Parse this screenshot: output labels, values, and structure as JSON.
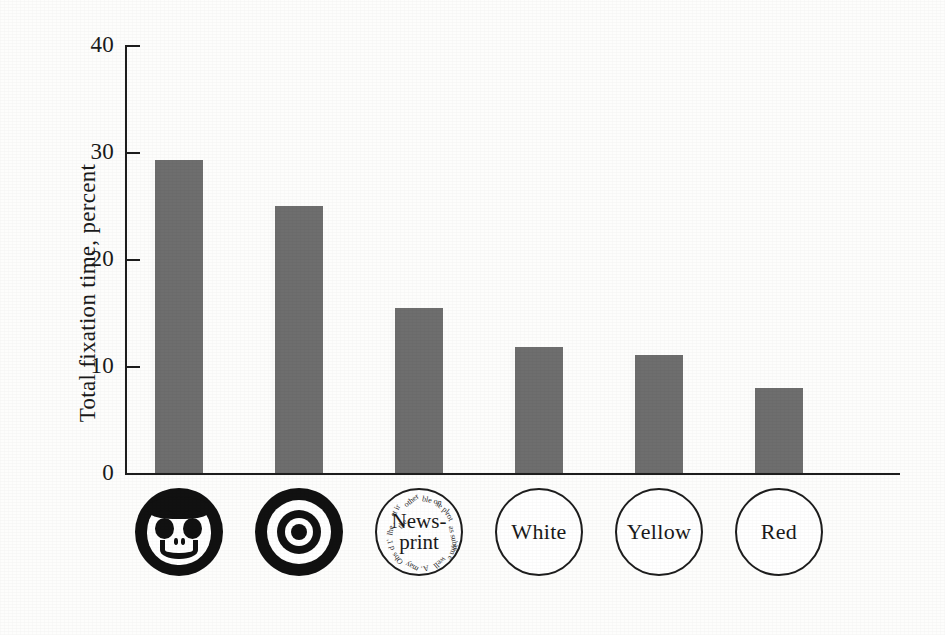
{
  "chart_data": {
    "type": "bar",
    "title": "",
    "subtitle": "",
    "xlabel": "",
    "ylabel": "Total fixation time, percent",
    "ylim": [
      0,
      40
    ],
    "yticks": [
      "0",
      "10",
      "20",
      "30",
      "40"
    ],
    "ytick_values": [
      0,
      10,
      20,
      30,
      40
    ],
    "grid": false,
    "legend": "none",
    "bar_color": "#6e6e6e",
    "axis_color": "#1d1d1d",
    "background_color": "#fdfdfc",
    "categories": [
      "Face",
      "Bullseye",
      "Newsprint",
      "White",
      "Yellow",
      "Red"
    ],
    "values": [
      29.3,
      25.0,
      15.4,
      11.8,
      11.0,
      7.9
    ]
  },
  "axis": {
    "y_title": "Total fixation time, percent",
    "ticks": [
      {
        "label": "40",
        "value": 40
      },
      {
        "label": "30",
        "value": 30
      },
      {
        "label": "20",
        "value": 20
      },
      {
        "label": "10",
        "value": 10
      },
      {
        "label": "0",
        "value": 0
      }
    ]
  },
  "categories": [
    {
      "id": "face",
      "icon": "smiley-face-icon",
      "label": "",
      "value": 29.3
    },
    {
      "id": "bullseye",
      "icon": "bullseye-target-icon",
      "label": "",
      "value": 25.0
    },
    {
      "id": "newsprint",
      "icon": "newsprint-circle-icon",
      "label_line1": "News-",
      "label_line2": "print",
      "fragments": [
        "et ir",
        "other",
        "ble on",
        "se pl",
        "rot",
        "lhe .",
        "d 1'",
        "the .",
        "as subje",
        "Obs",
        "may",
        "A.",
        "well",
        "om e"
      ],
      "value": 15.4
    },
    {
      "id": "white",
      "icon": "plain-circle-icon",
      "label": "White",
      "value": 11.8
    },
    {
      "id": "yellow",
      "icon": "plain-circle-icon",
      "label": "Yellow",
      "value": 11.0
    },
    {
      "id": "red",
      "icon": "plain-circle-icon",
      "label": "Red",
      "value": 7.9
    }
  ]
}
